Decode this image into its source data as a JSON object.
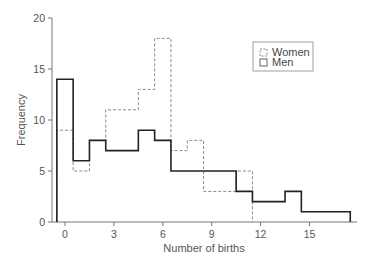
{
  "chart_data": {
    "type": "histogram",
    "title": "",
    "xlabel": "Number of births",
    "ylabel": "Frequency",
    "xlim": [
      -0.5,
      17.5
    ],
    "ylim": [
      0,
      20
    ],
    "grid": false,
    "legend_position": "upper right",
    "x_ticks": [
      0,
      3,
      6,
      9,
      12,
      15
    ],
    "y_ticks": [
      0,
      5,
      10,
      15,
      20
    ],
    "categories": [
      0,
      1,
      2,
      3,
      4,
      5,
      6,
      7,
      8,
      9,
      10,
      11,
      12,
      13,
      14,
      15,
      16,
      17
    ],
    "series": [
      {
        "name": "Women",
        "style": "dashed",
        "color": "#8a8a8a",
        "values": [
          9,
          5,
          8,
          11,
          11,
          13,
          18,
          7,
          8,
          3,
          3,
          5,
          0,
          0,
          0,
          0,
          0,
          0
        ]
      },
      {
        "name": "Men",
        "style": "solid",
        "color": "#222222",
        "values": [
          14,
          6,
          8,
          7,
          7,
          9,
          8,
          5,
          5,
          5,
          5,
          3,
          2,
          2,
          3,
          1,
          1,
          1
        ]
      }
    ]
  },
  "legend": {
    "items": [
      {
        "label": "Women"
      },
      {
        "label": "Men"
      }
    ]
  },
  "axes": {
    "x_title": "Number of births",
    "y_title": "Frequency",
    "x_tick_labels": [
      "0",
      "3",
      "6",
      "9",
      "12",
      "15"
    ],
    "y_tick_labels": [
      "0",
      "5",
      "10",
      "15",
      "20"
    ]
  }
}
